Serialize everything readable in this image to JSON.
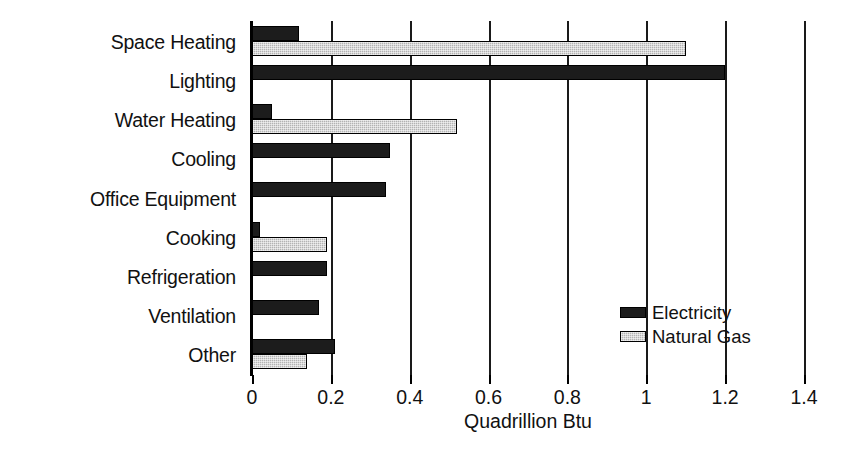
{
  "chart_data": {
    "type": "bar",
    "orientation": "horizontal",
    "title": "",
    "xlabel": "Quadrillion Btu",
    "ylabel": "",
    "xlim": [
      0,
      1.4
    ],
    "xticks": [
      0,
      0.2,
      0.4,
      0.6,
      0.8,
      1,
      1.4
    ],
    "xtick_labels": [
      "0",
      "0.2",
      "0.4",
      "0.6",
      "0.8",
      "1",
      "1.2",
      "1.4"
    ],
    "xtick_values": [
      0,
      0.2,
      0.4,
      0.6,
      0.8,
      1.0,
      1.2,
      1.4
    ],
    "grid": "vertical",
    "legend_position": "inside-lower-right",
    "categories": [
      "Space Heating",
      "Lighting",
      "Water Heating",
      "Cooling",
      "Office Equipment",
      "Cooking",
      "Refrigeration",
      "Ventilation",
      "Other"
    ],
    "series": [
      {
        "name": "Electricity",
        "color": "#1c1c1c",
        "values": [
          0.12,
          1.2,
          0.05,
          0.35,
          0.34,
          0.02,
          0.19,
          0.17,
          0.21
        ]
      },
      {
        "name": "Natural Gas",
        "color": "#b3b3b3",
        "values": [
          1.1,
          0,
          0.52,
          0,
          0,
          0.19,
          0,
          0,
          0.14
        ]
      }
    ]
  },
  "legend": {
    "items": [
      {
        "label": "Electricity",
        "swatch": "electricity"
      },
      {
        "label": "Natural Gas",
        "swatch": "gas"
      }
    ]
  }
}
